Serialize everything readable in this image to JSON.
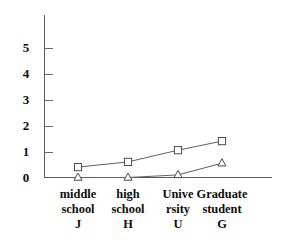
{
  "chart_data": {
    "type": "line",
    "title": "",
    "subtitle": "",
    "xlabel": "",
    "ylabel": "",
    "ylim": [
      0,
      5.8
    ],
    "yticks": [
      0,
      1,
      2,
      3,
      4,
      5
    ],
    "ytick_labels": [
      "0",
      "1",
      "2",
      "3",
      "4",
      "5"
    ],
    "grid": false,
    "legend": "none",
    "categories": [
      "middle school J",
      "high school H",
      "Unive rsity U",
      "Graduate student G"
    ],
    "category_lines": [
      [
        "middle",
        "school",
        "J"
      ],
      [
        "high",
        "school",
        "H"
      ],
      [
        "Unive",
        "rsity",
        "U"
      ],
      [
        "Graduate",
        "student",
        "G"
      ]
    ],
    "series": [
      {
        "name": "square-series",
        "marker": "square",
        "values": [
          0.4,
          0.6,
          1.05,
          1.4
        ]
      },
      {
        "name": "triangle-series",
        "marker": "triangle",
        "values": [
          0.0,
          0.0,
          0.1,
          0.55
        ]
      }
    ],
    "colors": {
      "axis": "#5a5a5a",
      "line": "#606060",
      "marker_stroke": "#4a4a4a",
      "marker_fill": "#ffffff",
      "text": "#0d0d0d",
      "background": "#ffffff"
    }
  },
  "axis": {
    "y_labels": [
      "5",
      "4",
      "3",
      "2",
      "1",
      "0"
    ]
  }
}
